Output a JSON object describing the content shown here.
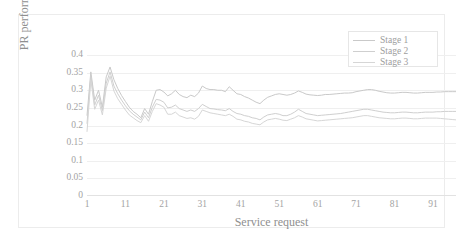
{
  "chart_data": {
    "type": "line",
    "title": "",
    "xlabel": "Service request",
    "ylabel": "PR performance",
    "xlim": [
      1,
      97
    ],
    "ylim": [
      0,
      0.4
    ],
    "ytick_labels": [
      "0.4",
      "0.35",
      "0.3",
      "0.25",
      "0.2",
      "0.15",
      "0.1",
      "0.05",
      "0"
    ],
    "ytick_values": [
      0.4,
      0.35,
      0.3,
      0.25,
      0.2,
      0.15,
      0.1,
      0.05,
      0
    ],
    "xtick_labels": [
      "1",
      "11",
      "21",
      "31",
      "41",
      "51",
      "61",
      "71",
      "81",
      "91"
    ],
    "xtick_values": [
      1,
      11,
      21,
      31,
      41,
      51,
      61,
      71,
      81,
      91
    ],
    "grid": "horizontal",
    "legend_position": "top-right",
    "x": [
      1,
      2,
      3,
      4,
      5,
      6,
      7,
      8,
      9,
      10,
      11,
      12,
      13,
      14,
      15,
      16,
      17,
      18,
      19,
      20,
      21,
      22,
      23,
      24,
      25,
      26,
      27,
      28,
      29,
      30,
      31,
      32,
      33,
      34,
      35,
      36,
      37,
      38,
      39,
      40,
      41,
      42,
      43,
      44,
      45,
      46,
      47,
      48,
      49,
      50,
      51,
      52,
      53,
      54,
      55,
      56,
      57,
      58,
      59,
      60,
      61,
      62,
      63,
      64,
      65,
      66,
      67,
      68,
      69,
      70,
      71,
      72,
      73,
      74,
      75,
      76,
      77,
      78,
      79,
      80,
      81,
      82,
      83,
      84,
      85,
      86,
      87,
      88,
      89,
      90,
      91,
      92,
      93,
      94,
      95,
      96,
      97
    ],
    "series": [
      {
        "name": "Stage 1",
        "color": "#c9c9c9",
        "values": [
          0.228,
          0.352,
          0.272,
          0.3,
          0.252,
          0.338,
          0.366,
          0.33,
          0.305,
          0.285,
          0.268,
          0.252,
          0.24,
          0.232,
          0.222,
          0.248,
          0.232,
          0.268,
          0.3,
          0.302,
          0.295,
          0.284,
          0.29,
          0.3,
          0.288,
          0.282,
          0.279,
          0.286,
          0.282,
          0.292,
          0.312,
          0.305,
          0.302,
          0.302,
          0.3,
          0.3,
          0.296,
          0.31,
          0.3,
          0.29,
          0.288,
          0.282,
          0.278,
          0.272,
          0.266,
          0.262,
          0.272,
          0.28,
          0.284,
          0.288,
          0.29,
          0.288,
          0.286,
          0.288,
          0.292,
          0.298,
          0.294,
          0.289,
          0.287,
          0.286,
          0.285,
          0.286,
          0.288,
          0.288,
          0.289,
          0.29,
          0.291,
          0.292,
          0.292,
          0.293,
          0.296,
          0.298,
          0.3,
          0.302,
          0.302,
          0.3,
          0.297,
          0.295,
          0.293,
          0.292,
          0.292,
          0.293,
          0.294,
          0.294,
          0.293,
          0.292,
          0.292,
          0.293,
          0.294,
          0.294,
          0.294,
          0.295,
          0.295,
          0.296,
          0.296,
          0.296,
          0.296
        ]
      },
      {
        "name": "Stage 2",
        "color": "#cfcfcf",
        "values": [
          0.205,
          0.342,
          0.258,
          0.286,
          0.242,
          0.32,
          0.352,
          0.312,
          0.29,
          0.272,
          0.256,
          0.242,
          0.232,
          0.224,
          0.216,
          0.238,
          0.222,
          0.252,
          0.274,
          0.272,
          0.266,
          0.25,
          0.252,
          0.258,
          0.248,
          0.244,
          0.24,
          0.244,
          0.24,
          0.248,
          0.26,
          0.254,
          0.248,
          0.247,
          0.245,
          0.244,
          0.242,
          0.248,
          0.24,
          0.234,
          0.232,
          0.228,
          0.226,
          0.222,
          0.22,
          0.216,
          0.224,
          0.23,
          0.232,
          0.234,
          0.232,
          0.228,
          0.228,
          0.232,
          0.238,
          0.246,
          0.24,
          0.234,
          0.232,
          0.23,
          0.228,
          0.229,
          0.23,
          0.231,
          0.232,
          0.233,
          0.234,
          0.236,
          0.238,
          0.24,
          0.242,
          0.244,
          0.246,
          0.246,
          0.244,
          0.242,
          0.24,
          0.238,
          0.237,
          0.236,
          0.236,
          0.237,
          0.238,
          0.238,
          0.237,
          0.236,
          0.236,
          0.237,
          0.238,
          0.238,
          0.238,
          0.239,
          0.239,
          0.24,
          0.24,
          0.24,
          0.24
        ]
      },
      {
        "name": "Stage 3",
        "color": "#d6d6d6",
        "values": [
          0.182,
          0.33,
          0.246,
          0.272,
          0.23,
          0.306,
          0.34,
          0.298,
          0.276,
          0.26,
          0.244,
          0.23,
          0.222,
          0.214,
          0.208,
          0.228,
          0.212,
          0.24,
          0.262,
          0.258,
          0.252,
          0.232,
          0.232,
          0.238,
          0.228,
          0.224,
          0.22,
          0.222,
          0.218,
          0.226,
          0.244,
          0.24,
          0.236,
          0.234,
          0.232,
          0.23,
          0.228,
          0.232,
          0.226,
          0.218,
          0.216,
          0.212,
          0.21,
          0.206,
          0.204,
          0.202,
          0.21,
          0.216,
          0.218,
          0.22,
          0.218,
          0.215,
          0.214,
          0.218,
          0.222,
          0.228,
          0.224,
          0.219,
          0.217,
          0.215,
          0.213,
          0.214,
          0.215,
          0.216,
          0.217,
          0.218,
          0.219,
          0.22,
          0.221,
          0.222,
          0.224,
          0.226,
          0.228,
          0.228,
          0.226,
          0.224,
          0.222,
          0.221,
          0.22,
          0.219,
          0.219,
          0.22,
          0.221,
          0.221,
          0.22,
          0.219,
          0.219,
          0.22,
          0.221,
          0.221,
          0.221,
          0.221,
          0.22,
          0.219,
          0.218,
          0.217,
          0.216
        ]
      }
    ]
  },
  "legend": {
    "items": [
      {
        "label": "Stage 1"
      },
      {
        "label": "Stage 2"
      },
      {
        "label": "Stage 3"
      }
    ]
  }
}
